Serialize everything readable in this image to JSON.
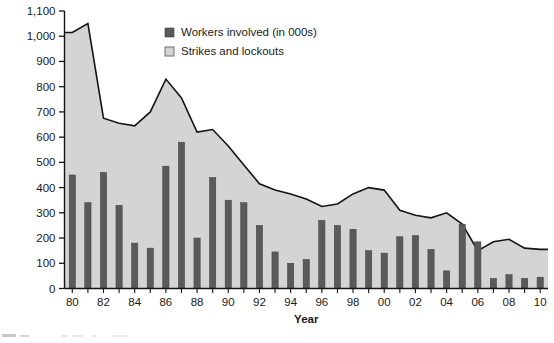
{
  "chart_data": {
    "type": "area",
    "title": "",
    "xlabel": "Year",
    "ylabel": "",
    "ylim": [
      0,
      1100
    ],
    "ytick_values": [
      0,
      100,
      200,
      300,
      400,
      500,
      600,
      700,
      800,
      900,
      1000,
      1100
    ],
    "ytick_labels": [
      "0",
      "100",
      "200",
      "300",
      "400",
      "500",
      "600",
      "700",
      "800",
      "900",
      "1,000",
      "1,100"
    ],
    "grid": "horizontal-faint",
    "legend_position": "top-center",
    "x": [
      "80",
      "81",
      "82",
      "83",
      "84",
      "85",
      "86",
      "87",
      "88",
      "89",
      "90",
      "91",
      "92",
      "93",
      "94",
      "95",
      "96",
      "97",
      "98",
      "99",
      "00",
      "01",
      "02",
      "03",
      "04",
      "05",
      "06",
      "07",
      "08",
      "09",
      "10"
    ],
    "xtick_labels": [
      "80",
      "82",
      "84",
      "86",
      "88",
      "90",
      "92",
      "94",
      "96",
      "98",
      "00",
      "02",
      "04",
      "06",
      "08",
      "10"
    ],
    "series": [
      {
        "name": "Strikes and lockouts",
        "type": "area",
        "color": "#d4d4d4",
        "line_color": "#141414",
        "values": [
          1015,
          1050,
          675,
          655,
          645,
          700,
          830,
          755,
          620,
          630,
          565,
          490,
          415,
          390,
          375,
          355,
          325,
          335,
          375,
          400,
          390,
          310,
          290,
          280,
          300,
          255,
          150,
          185,
          195,
          160,
          155
        ]
      },
      {
        "name": "Workers involved (in 000s)",
        "type": "bar",
        "color": "#5a5a5a",
        "values": [
          450,
          340,
          460,
          330,
          180,
          160,
          485,
          580,
          200,
          440,
          350,
          340,
          250,
          145,
          100,
          115,
          270,
          250,
          235,
          150,
          140,
          205,
          210,
          155,
          70,
          255,
          185,
          40,
          55,
          40,
          45
        ]
      }
    ],
    "legend": [
      {
        "label": "Workers involved (in 000s)",
        "swatch": "#5a5a5a",
        "swatch_type": "filled"
      },
      {
        "label": "Strikes and lockouts",
        "swatch": "#d4d4d4",
        "swatch_type": "outlined"
      }
    ]
  }
}
